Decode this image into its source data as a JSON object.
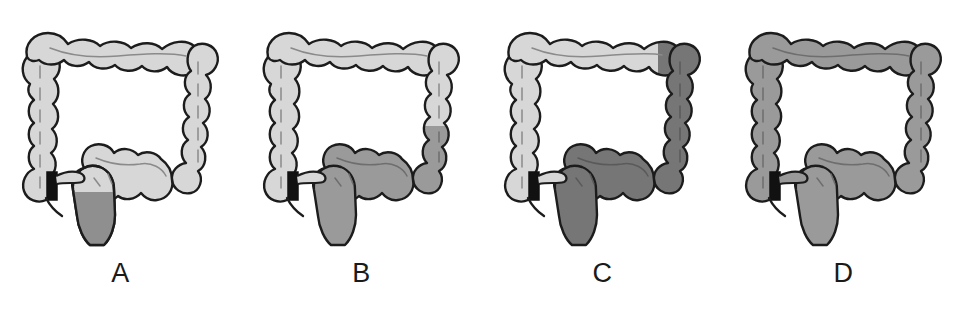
{
  "figure": {
    "type": "medical-illustration",
    "panel_count": 4,
    "background_color": "#ffffff"
  },
  "colors": {
    "unaffected_fill": "#d7d7d7",
    "affected_light_fill": "#d7d7d7",
    "affected_medium_fill": "#9a9a9a",
    "affected_dark_fill": "#767676",
    "outline": "#1c1c1c",
    "haustra_line": "#8a8a8a",
    "ileum_black": "#111111",
    "label_color": "#1a1a1a"
  },
  "panels": [
    {
      "id": "panel-a",
      "label": "A",
      "affected_shade": "#8f8f8f",
      "affected_segments": [
        "rectum"
      ],
      "unaffected_segments": [
        "cecum",
        "ascending colon",
        "hepatic flexure",
        "transverse colon",
        "splenic flexure",
        "descending colon",
        "sigmoid colon"
      ]
    },
    {
      "id": "panel-b",
      "label": "B",
      "affected_shade": "#9a9a9a",
      "affected_segments": [
        "rectum",
        "sigmoid colon",
        "distal descending colon"
      ],
      "unaffected_segments": [
        "cecum",
        "ascending colon",
        "hepatic flexure",
        "transverse colon",
        "splenic flexure",
        "proximal descending colon"
      ]
    },
    {
      "id": "panel-c",
      "label": "C",
      "affected_shade": "#767676",
      "affected_segments": [
        "rectum",
        "sigmoid colon",
        "descending colon",
        "splenic flexure"
      ],
      "unaffected_segments": [
        "cecum",
        "ascending colon",
        "hepatic flexure",
        "transverse colon"
      ]
    },
    {
      "id": "panel-d",
      "label": "D",
      "affected_shade": "#9a9a9a",
      "affected_segments": [
        "cecum",
        "ascending colon",
        "hepatic flexure",
        "transverse colon",
        "splenic flexure",
        "descending colon",
        "sigmoid colon",
        "rectum"
      ],
      "unaffected_segments": []
    }
  ]
}
